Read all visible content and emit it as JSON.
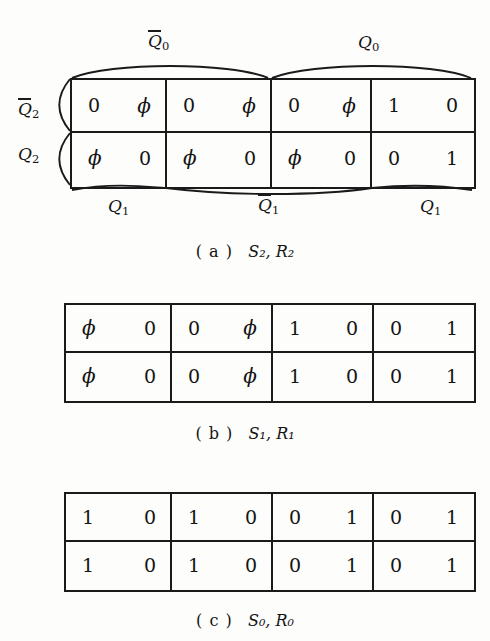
{
  "figure": {
    "background_color": "#fdfdfc",
    "ink_color": "#1a1a1a",
    "panels": [
      {
        "id": "a",
        "caption_paren": "( a )",
        "caption_symbols": "S₂,  R₂",
        "caption_plain": "(a) S2, R2",
        "top_labels": [
          {
            "text": "Q0",
            "overbar": true,
            "display": "Q̈0",
            "base": "Q",
            "sub": "0"
          },
          {
            "text": "Q0",
            "overbar": false,
            "display": "Q0",
            "base": "Q",
            "sub": "0"
          }
        ],
        "left_labels": [
          {
            "text": "Q2",
            "overbar": true,
            "base": "Q",
            "sub": "2"
          },
          {
            "text": "Q2",
            "overbar": false,
            "base": "Q",
            "sub": "2"
          }
        ],
        "bottom_labels": [
          {
            "text": "Q1",
            "overbar": false,
            "base": "Q",
            "sub": "1"
          },
          {
            "text": "Q1",
            "overbar": true,
            "base": "Q",
            "sub": "1"
          },
          {
            "text": "Q1",
            "overbar": false,
            "base": "Q",
            "sub": "1"
          }
        ],
        "rows": [
          {
            "row_label": "Q2-bar",
            "cells": [
              [
                "0",
                "ϕ"
              ],
              [
                "0",
                "ϕ"
              ],
              [
                "0",
                "ϕ"
              ],
              [
                "1",
                "0"
              ]
            ]
          },
          {
            "row_label": "Q2",
            "cells": [
              [
                "ϕ",
                "0"
              ],
              [
                "ϕ",
                "0"
              ],
              [
                "ϕ",
                "0"
              ],
              [
                "0",
                "1"
              ]
            ]
          }
        ]
      },
      {
        "id": "b",
        "caption_paren": "( b )",
        "caption_symbols": "S₁,  R₁",
        "caption_plain": "(b) S1, R1",
        "top_labels": [],
        "left_labels": [],
        "bottom_labels": [],
        "rows": [
          {
            "row_label": "row-1",
            "cells": [
              [
                "ϕ",
                "0"
              ],
              [
                "0",
                "ϕ"
              ],
              [
                "1",
                "0"
              ],
              [
                "0",
                "1"
              ]
            ]
          },
          {
            "row_label": "row-2",
            "cells": [
              [
                "ϕ",
                "0"
              ],
              [
                "0",
                "ϕ"
              ],
              [
                "1",
                "0"
              ],
              [
                "0",
                "1"
              ]
            ]
          }
        ]
      },
      {
        "id": "c",
        "caption_paren": "( c )",
        "caption_symbols": "S₀,  R₀",
        "caption_plain": "(c) S0, R0",
        "top_labels": [],
        "left_labels": [],
        "bottom_labels": [],
        "rows": [
          {
            "row_label": "row-1",
            "cells": [
              [
                "1",
                "0"
              ],
              [
                "1",
                "0"
              ],
              [
                "0",
                "1"
              ],
              [
                "0",
                "1"
              ]
            ]
          },
          {
            "row_label": "row-2",
            "cells": [
              [
                "1",
                "0"
              ],
              [
                "1",
                "0"
              ],
              [
                "0",
                "1"
              ],
              [
                "0",
                "1"
              ]
            ]
          }
        ]
      }
    ]
  }
}
